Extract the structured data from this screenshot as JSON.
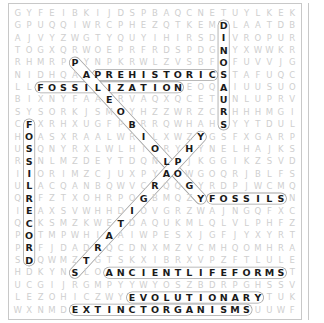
{
  "puzzle": {
    "rows": 25,
    "cols": 25,
    "grid": [
      "GYFEIBKIJDSPBAQCNETUYLKEK",
      "GPUQQIWRCPHEZQTKEMDLAATDB",
      "AJVYZWGTYQUYIHIRSDIVROPUR",
      "TOGXQRWOEPRFRDSPDGNYXWWKR",
      "RHMRPPYNPKRWLZVSBFOFUVVJG",
      "NIDHQAAPREHISTORICSTAFUQC",
      "LLFOSSILIZATIONEOQAIUUSUO",
      "BIXNYFAAERVAQXQCETUNLUPRV",
      "SYSORKJSMOYHZZWRZCRHHHMGI",
      "CFXRHXUGFPBRRQWHAHSYYTDUL",
      "HOASXRAALWRILXWZYGSFXGARP",
      "USQNYRXLWLHIORYHYNELHAJKS",
      "RSNLMZDEYTDQNLPJKGGIKZSVD",
      "IIORIMZCJUXPYAOWGOQRJBLFS",
      "ULACQANBQWVCRQQGYRDPJWCMQ",
      "QRFZTXOHRPOGBMQZYFOSSILSN",
      "IEAXSVWHHDIOVGRZWAJNGQFXC",
      "QCKSMZKWETDAQUKMLQLVLPHFZ",
      "POTMPWHIAAIWPESXJGFJYXYRT",
      "PRFJDADRQCDNXMZVCMHQOMHRA",
      "SDQWMZTGTSKXIBRXVPZFTLULE",
      "HDKYNSLOANCIENTLIFEFORMST",
      "UCGIJRGMPYYWYOSZBDRPGHSSV",
      "LEZOHICZWYEVOLUTIONARYTUK",
      "WXNMDEXTINCTORGANISMSUUWF"
    ],
    "found_words": [
      {
        "word": "DINOSAURS",
        "start": [
          1,
          18
        ],
        "end": [
          9,
          18
        ]
      },
      {
        "word": "PREHISTORIC",
        "start": [
          5,
          7
        ],
        "end": [
          5,
          17
        ]
      },
      {
        "word": "FOSSILIZATION",
        "start": [
          6,
          2
        ],
        "end": [
          6,
          14
        ]
      },
      {
        "word": "PALEOBIOLOGY",
        "start": [
          4,
          5
        ],
        "end": [
          15,
          16
        ]
      },
      {
        "word": "FOSSILRECORD",
        "start": [
          9,
          1
        ],
        "end": [
          20,
          1
        ]
      },
      {
        "word": "STRATIGRAPHY",
        "start": [
          21,
          5
        ],
        "end": [
          10,
          16
        ]
      },
      {
        "word": "FOSSILS",
        "start": [
          15,
          17
        ],
        "end": [
          15,
          23
        ]
      },
      {
        "word": "ANCIENTLIFEFORMS",
        "start": [
          21,
          8
        ],
        "end": [
          21,
          23
        ]
      },
      {
        "word": "EVOLUTIONARY",
        "start": [
          23,
          10
        ],
        "end": [
          23,
          21
        ]
      },
      {
        "word": "EXTINCTORGANISMS",
        "start": [
          24,
          5
        ],
        "end": [
          24,
          20
        ]
      }
    ]
  },
  "colors": {
    "background": "#ffffff",
    "border": "#c8c8c8",
    "letter_dim": "#cfcfcf",
    "letter_found": "#1a1a1a",
    "highlight_stroke": "#9a9a9a"
  }
}
